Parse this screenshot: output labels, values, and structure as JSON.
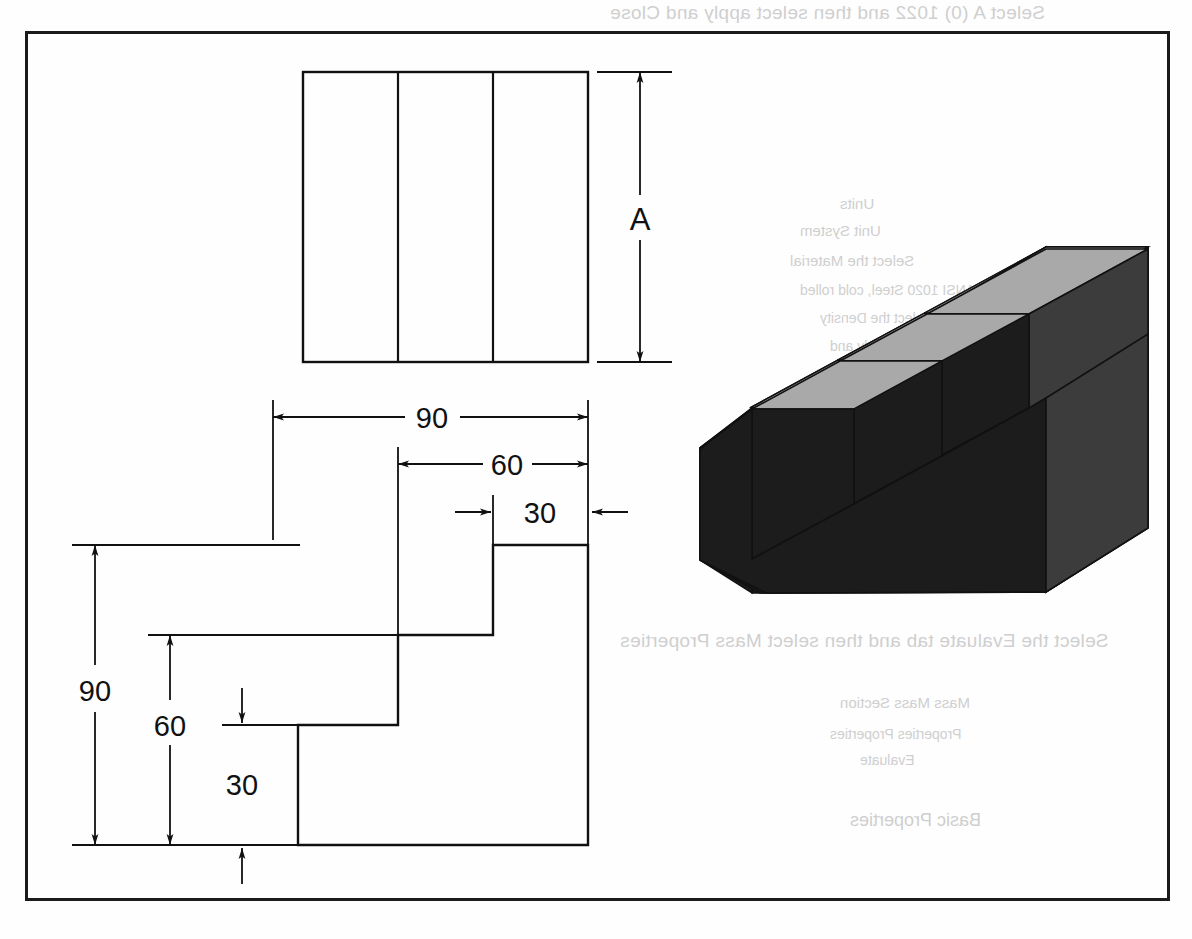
{
  "document": {
    "type": "engineering-drawing",
    "title": "Orthographic views and isometric pictorial of a stepped block",
    "frame": {
      "border_color": "#1b1b1b"
    }
  },
  "drawing": {
    "top_view": {
      "name": "top-view",
      "description": "Rectangle divided into three equal vertical bands",
      "divisions": 3,
      "dimension_label": "A"
    },
    "front_view": {
      "name": "front-view",
      "description": "Stepped (staircase) profile, three rising steps",
      "steps": 3
    },
    "pictorial": {
      "name": "isometric-pictorial",
      "description": "Shaded isometric view of the stepped block",
      "top_face_color": "#a9a9a9",
      "front_face_color": "#1c1c1c",
      "side_face_color": "#3c3c3c"
    }
  },
  "dimensions": {
    "horizontal": [
      {
        "id": "h-90",
        "value": "90"
      },
      {
        "id": "h-60",
        "value": "60"
      },
      {
        "id": "h-30",
        "value": "30"
      }
    ],
    "vertical": [
      {
        "id": "v-90",
        "value": "90"
      },
      {
        "id": "v-60",
        "value": "60"
      },
      {
        "id": "v-30",
        "value": "30"
      }
    ],
    "depth": [
      {
        "id": "d-A",
        "value": "A"
      }
    ]
  },
  "bleed_through_text": {
    "top_line": "Select A (0) 1022 and then select apply and Close",
    "line_1": "Units",
    "line_2": "Unit System",
    "line_3": "Select the Material",
    "line_4": "ANSI 1020 Steel, cold rolled",
    "line_5": "Select the Density",
    "line_6": "select apply and",
    "line_7": "select Properties",
    "line_8": "close",
    "line_9": "Apply",
    "heading": "Solution",
    "question_11": "Select the Evaluate tab and then select Mass Properties",
    "result_1": "Mass      Mass      Section",
    "result_2": "Properties   Properties",
    "result_3": "Evaluate",
    "result_4": "Basic  Properties"
  }
}
